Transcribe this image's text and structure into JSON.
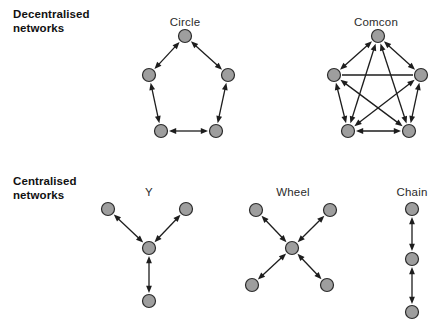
{
  "figure": {
    "caption_rows": [
      {
        "id": "decentralised",
        "label": "Decentralised\nnetworks"
      },
      {
        "id": "centralised",
        "label": "Centralised\nnetworks"
      }
    ],
    "colors": {
      "node_fill": "#9e9e9e",
      "node_stroke": "#2b2b2b",
      "edge": "#1d1d1d",
      "text": "#2b2b2b",
      "label_text": "#111111",
      "background": "#ffffff"
    },
    "node_radius": 6.5,
    "diagrams": [
      {
        "id": "circle",
        "title": "Circle",
        "row": "decentralised",
        "title_x": 185,
        "title_y": 16,
        "nodes": [
          {
            "id": "n1",
            "x": 185,
            "y": 36
          },
          {
            "id": "n2",
            "x": 228,
            "y": 75
          },
          {
            "id": "n3",
            "x": 216,
            "y": 131
          },
          {
            "id": "n4",
            "x": 161,
            "y": 131
          },
          {
            "id": "n5",
            "x": 149,
            "y": 75
          }
        ],
        "edges": [
          {
            "from": "n1",
            "to": "n2",
            "arrows": "both"
          },
          {
            "from": "n2",
            "to": "n3",
            "arrows": "both"
          },
          {
            "from": "n3",
            "to": "n4",
            "arrows": "both"
          },
          {
            "from": "n4",
            "to": "n5",
            "arrows": "both"
          },
          {
            "from": "n5",
            "to": "n1",
            "arrows": "both"
          }
        ]
      },
      {
        "id": "comcon",
        "title": "Comcon",
        "row": "decentralised",
        "title_x": 376,
        "title_y": 16,
        "nodes": [
          {
            "id": "n1",
            "x": 378,
            "y": 36
          },
          {
            "id": "n2",
            "x": 421,
            "y": 75
          },
          {
            "id": "n3",
            "x": 409,
            "y": 131
          },
          {
            "id": "n4",
            "x": 348,
            "y": 131
          },
          {
            "id": "n5",
            "x": 334,
            "y": 75
          }
        ],
        "edges": [
          {
            "from": "n1",
            "to": "n2",
            "arrows": "both"
          },
          {
            "from": "n2",
            "to": "n3",
            "arrows": "both"
          },
          {
            "from": "n3",
            "to": "n4",
            "arrows": "both"
          },
          {
            "from": "n4",
            "to": "n5",
            "arrows": "both"
          },
          {
            "from": "n5",
            "to": "n1",
            "arrows": "both"
          },
          {
            "from": "n1",
            "to": "n3",
            "arrows": "both"
          },
          {
            "from": "n1",
            "to": "n4",
            "arrows": "both"
          },
          {
            "from": "n2",
            "to": "n4",
            "arrows": "both"
          },
          {
            "from": "n3",
            "to": "n5",
            "arrows": "both"
          },
          {
            "from": "n5",
            "to": "n2",
            "arrows": "none"
          }
        ]
      },
      {
        "id": "y",
        "title": "Y",
        "row": "centralised",
        "title_x": 149,
        "title_y": 186,
        "nodes": [
          {
            "id": "c",
            "x": 149,
            "y": 248
          },
          {
            "id": "ul",
            "x": 108,
            "y": 209
          },
          {
            "id": "ur",
            "x": 186,
            "y": 209
          },
          {
            "id": "b",
            "x": 149,
            "y": 301
          }
        ],
        "edges": [
          {
            "from": "c",
            "to": "ul",
            "arrows": "both"
          },
          {
            "from": "c",
            "to": "ur",
            "arrows": "both"
          },
          {
            "from": "c",
            "to": "b",
            "arrows": "both"
          }
        ]
      },
      {
        "id": "wheel",
        "title": "Wheel",
        "row": "centralised",
        "title_x": 293,
        "title_y": 186,
        "nodes": [
          {
            "id": "c",
            "x": 292,
            "y": 248
          },
          {
            "id": "ul",
            "x": 256,
            "y": 210
          },
          {
            "id": "ur",
            "x": 330,
            "y": 210
          },
          {
            "id": "bl",
            "x": 252,
            "y": 285
          },
          {
            "id": "br",
            "x": 327,
            "y": 285
          }
        ],
        "edges": [
          {
            "from": "c",
            "to": "ul",
            "arrows": "both"
          },
          {
            "from": "c",
            "to": "ur",
            "arrows": "both"
          },
          {
            "from": "c",
            "to": "bl",
            "arrows": "both"
          },
          {
            "from": "c",
            "to": "br",
            "arrows": "both"
          }
        ]
      },
      {
        "id": "chain",
        "title": "Chain",
        "row": "centralised",
        "title_x": 412,
        "title_y": 186,
        "nodes": [
          {
            "id": "t",
            "x": 412,
            "y": 209
          },
          {
            "id": "m",
            "x": 412,
            "y": 259
          },
          {
            "id": "b",
            "x": 412,
            "y": 312
          }
        ],
        "edges": [
          {
            "from": "t",
            "to": "m",
            "arrows": "both"
          },
          {
            "from": "m",
            "to": "b",
            "arrows": "both"
          }
        ]
      }
    ]
  }
}
